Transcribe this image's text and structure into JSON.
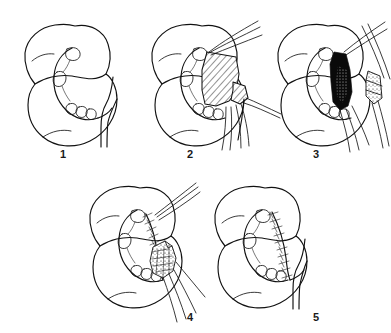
{
  "figure": {
    "background_color": "#ffffff",
    "ink_color": "#111111",
    "width": 391,
    "height": 333,
    "layout": "two rows: three panels on top, two panels on bottom",
    "panel_count": 5
  },
  "panels": [
    {
      "number": "1",
      "caption": "",
      "name": "panel-step-1",
      "description": "Kidney in outline with renal pelvis, calyces and ureter exposed",
      "features": [
        "kidney-outline",
        "renal-calyces",
        "renal-pelvis",
        "ureter"
      ]
    },
    {
      "number": "2",
      "caption": "",
      "name": "panel-step-2",
      "description": "Planned wedge of renal parenchyma marked with diagonal hatching, traction sutures and vessel loops applied",
      "features": [
        "kidney-outline",
        "hatched-resection-area",
        "traction-suture",
        "vascular-clamp"
      ]
    },
    {
      "number": "3",
      "caption": "",
      "name": "panel-step-3",
      "description": "Wedge excised leaving a dark open defect; the resected specimen is held in forceps to the right",
      "features": [
        "kidney-outline",
        "black-wedge-defect",
        "excised-specimen",
        "forceps"
      ]
    },
    {
      "number": "4",
      "caption": "",
      "name": "panel-step-4",
      "description": "Defect being closed with interrupted sutures over a stippled parenchymal flap",
      "features": [
        "kidney-outline",
        "interrupted-sutures",
        "suture-tails",
        "parenchymal-flap"
      ]
    },
    {
      "number": "5",
      "caption": "",
      "name": "panel-step-5",
      "description": "Completed closure showing a continuous running suture line along the resection margin",
      "features": [
        "kidney-outline",
        "running-suture-line",
        "ureter"
      ]
    }
  ]
}
